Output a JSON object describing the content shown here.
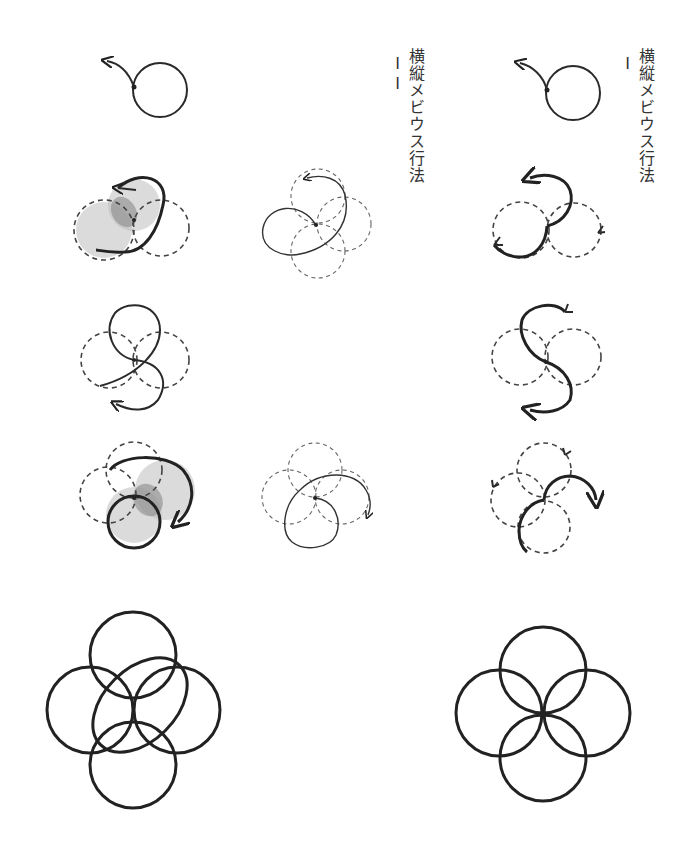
{
  "labels": {
    "method_ii": {
      "text": "横縦メビウス行法",
      "numeral": "II"
    },
    "method_i": {
      "text": "横縦メビウス行法",
      "numeral": "I"
    }
  },
  "columns": [
    {
      "id": "method-ii-left",
      "figures": [
        "single-loop-with-arrow",
        "shaded-three-circle-step",
        "s-curve-three-circle-step",
        "shaded-four-circle-step",
        "final-four-circle-interlaced"
      ]
    },
    {
      "id": "method-ii-middle",
      "figures": [
        "thin-dashed-four-circle-step-a",
        "thin-dashed-four-circle-step-b"
      ]
    },
    {
      "id": "method-i",
      "figures": [
        "single-loop-with-arrow",
        "three-circle-arc-step",
        "s-curve-three-circle-step",
        "four-circle-arc-step",
        "final-four-circle-rosette"
      ]
    }
  ],
  "colors": {
    "line": "#2a2a2a",
    "dashed": "#444444",
    "shade_light": "#bdbdbd",
    "shade_dark": "#8a8a8a",
    "background": "#ffffff"
  }
}
